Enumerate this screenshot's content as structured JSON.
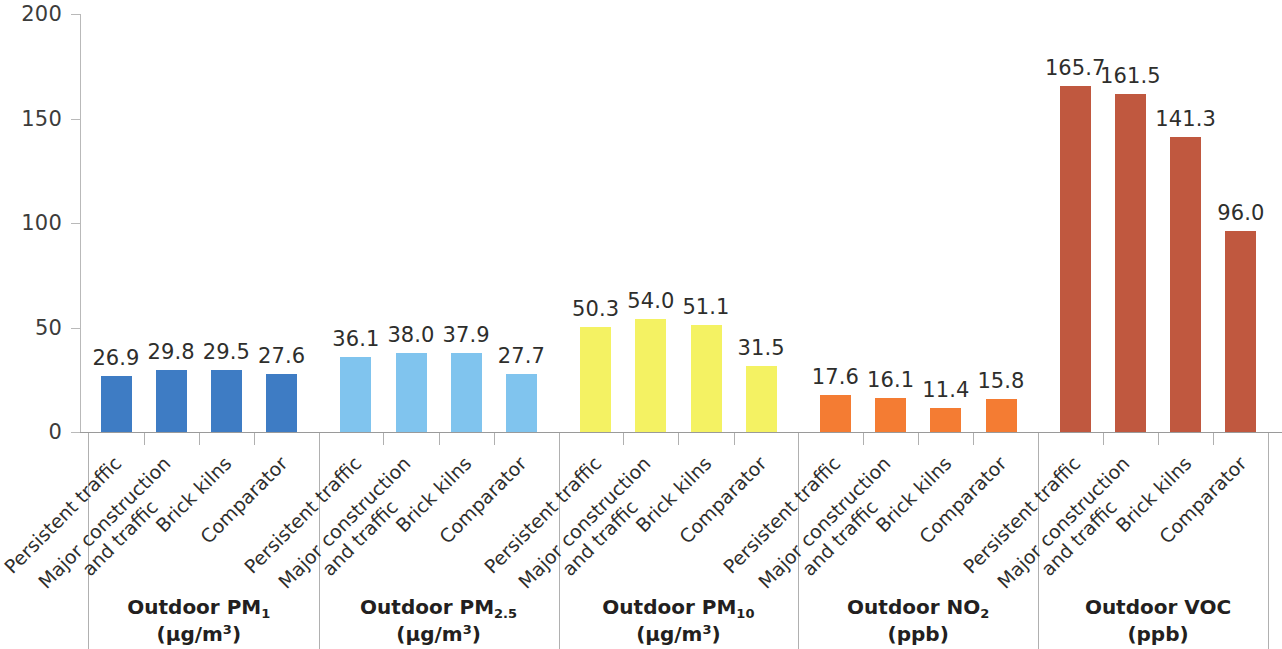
{
  "chart_data": {
    "type": "bar",
    "title": "",
    "xlabel": "",
    "ylabel": "",
    "ylim": [
      0,
      200
    ],
    "yticks": [
      0,
      50,
      100,
      150,
      200
    ],
    "grid": false,
    "legend": "none",
    "categories": [
      "Persistent traffic",
      "Major construction and traffic",
      "Brick kilns",
      "Comparator"
    ],
    "groups": [
      {
        "name": "Outdoor PM1",
        "label_main": "Outdoor PM",
        "label_sub": "1",
        "label_unit": "(µg/m³)",
        "unit_base": "(µg/m",
        "unit_sup": "3",
        "unit_close": ")",
        "color": "#3e7cc4",
        "values": [
          26.9,
          29.8,
          29.5,
          27.6
        ],
        "value_labels": [
          "26.9",
          "29.8",
          "29.5",
          "27.6"
        ]
      },
      {
        "name": "Outdoor PM2.5",
        "label_main": "Outdoor PM",
        "label_sub": "2.5",
        "label_unit": "(µg/m³)",
        "unit_base": "(µg/m",
        "unit_sup": "3",
        "unit_close": ")",
        "color": "#80c4ee",
        "values": [
          36.1,
          38.0,
          37.9,
          27.7
        ],
        "value_labels": [
          "36.1",
          "38.0",
          "37.9",
          "27.7"
        ]
      },
      {
        "name": "Outdoor PM10",
        "label_main": "Outdoor PM",
        "label_sub": "10",
        "label_unit": "(µg/m³)",
        "unit_base": "(µg/m",
        "unit_sup": "3",
        "unit_close": ")",
        "color": "#f4f263",
        "values": [
          50.3,
          54.0,
          51.1,
          31.5
        ],
        "value_labels": [
          "50.3",
          "54.0",
          "51.1",
          "31.5"
        ]
      },
      {
        "name": "Outdoor NO2",
        "label_main": "Outdoor NO",
        "label_sub": "2",
        "label_unit": "(ppb)",
        "unit_base": "(ppb)",
        "unit_sup": "",
        "unit_close": "",
        "color": "#f47c33",
        "values": [
          17.6,
          16.1,
          11.4,
          15.8
        ],
        "value_labels": [
          "17.6",
          "16.1",
          "11.4",
          "15.8"
        ]
      },
      {
        "name": "Outdoor VOC",
        "label_main": "Outdoor VOC",
        "label_sub": "",
        "label_unit": "(ppb)",
        "unit_base": "(ppb)",
        "unit_sup": "",
        "unit_close": "",
        "color": "#c0583f",
        "values": [
          165.7,
          161.5,
          141.3,
          96.0
        ],
        "value_labels": [
          "165.7",
          "161.5",
          "141.3",
          "96.0"
        ]
      }
    ]
  },
  "axis": {
    "y_tick_labels": [
      "200",
      "150",
      "100",
      "50",
      "0"
    ]
  },
  "colors": {
    "pm1": "#3e7cc4",
    "pm25": "#80c4ee",
    "pm10": "#f4f263",
    "no2": "#f47c33",
    "voc": "#c0583f",
    "axis": "#b9b9b9",
    "text": "#231f20"
  }
}
